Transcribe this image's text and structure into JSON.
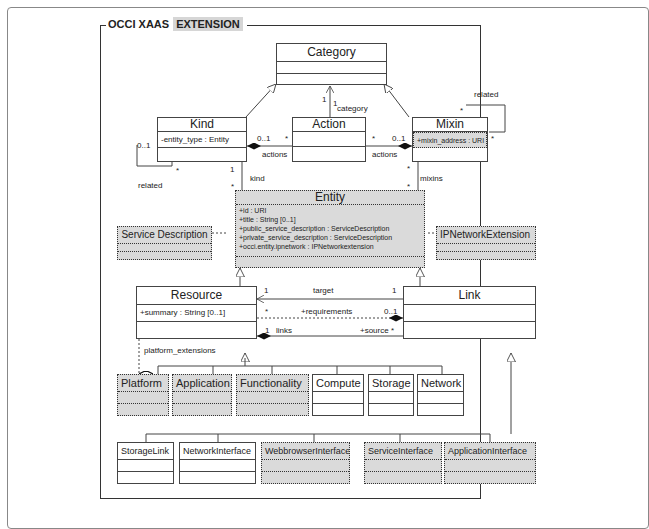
{
  "package": {
    "title": "OCCI XAAS",
    "title_highlight": "EXTENSION"
  },
  "classes": {
    "category": {
      "name": "Category",
      "attributes": []
    },
    "kind": {
      "name": "Kind",
      "attributes": [
        "-entity_type : Entity"
      ]
    },
    "action": {
      "name": "Action",
      "attributes": []
    },
    "mixin": {
      "name": "Mixin",
      "attributes": [
        "+mixin_address : URI"
      ]
    },
    "entity": {
      "name": "Entity",
      "attributes": [
        "+id : URI",
        "+title : String [0..1]",
        "+public_service_description : ServiceDescription",
        "+private_service_description : ServiceDescription",
        "+occi.entity.ipnetwork : IPNetworkextension"
      ]
    },
    "service_description": {
      "name": "Service Description",
      "attributes": []
    },
    "ipnetwork_extension": {
      "name": "IPNetworkExtension",
      "attributes": []
    },
    "resource": {
      "name": "Resource",
      "attributes": [
        "+summary : String [0..1]"
      ]
    },
    "link": {
      "name": "Link",
      "attributes": []
    },
    "platform": {
      "name": "Platform"
    },
    "application": {
      "name": "Application"
    },
    "functionality": {
      "name": "Functionality"
    },
    "compute": {
      "name": "Compute"
    },
    "storage": {
      "name": "Storage"
    },
    "network": {
      "name": "Network"
    },
    "storagelink": {
      "name": "StorageLink"
    },
    "networkinterface": {
      "name": "NetworkInterface"
    },
    "webbrowserinterface": {
      "name": "WebbrowserInterface"
    },
    "serviceinterface": {
      "name": "ServiceInterface"
    },
    "applicationinterface": {
      "name": "ApplicationInterface"
    }
  },
  "labels": {
    "category_mult_1a": "1",
    "category_mult_1b": "1",
    "category_role": "category",
    "kind_related_mult": "0..1",
    "kind_related_star": "*",
    "kind_related_role": "related",
    "kind_actions_mult": "0..1",
    "kind_actions_star": "*",
    "kind_actions_role": "actions",
    "mixin_actions_star": "*",
    "mixin_actions_mult": "0..1",
    "mixin_actions_role": "actions",
    "mixin_related_star1": "*",
    "mixin_related_star2": "*",
    "mixin_related_role": "related",
    "kind_entity_mult": "1",
    "kind_entity_star": "*",
    "kind_entity_role": "kind",
    "mixin_entity_star1": "*",
    "mixin_entity_star2": "*",
    "mixin_entity_role": "mixins",
    "target_mult_left": "1",
    "target_role": "target",
    "target_mult_right": "1",
    "req_star": "*",
    "req_role": "+requirements",
    "req_mult": "0..1",
    "links_mult": "1",
    "links_role": "links",
    "source_role": "+source *",
    "platform_ext_role": "platform_extensions"
  },
  "colors": {
    "extension_fill": "#dadada",
    "line": "#444444",
    "background": "#ffffff"
  }
}
